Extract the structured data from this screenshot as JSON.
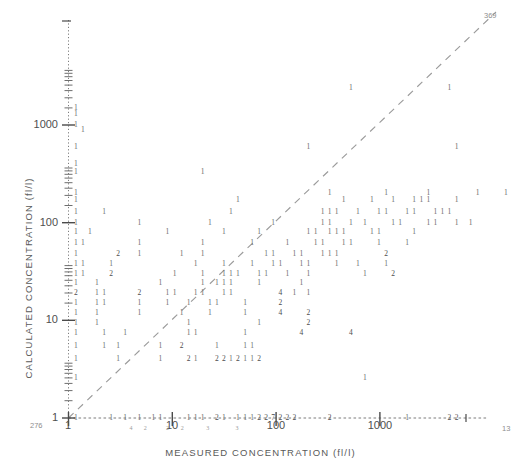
{
  "chart_data": {
    "type": "scatter",
    "title": "",
    "xlabel": "MEASURED CONCENTRATION (fl/l)",
    "ylabel": "CALCULATED CONCENTRATION (fl/l)",
    "xscale": "log",
    "yscale": "log",
    "xlim": [
      1,
      4000
    ],
    "ylim": [
      1,
      6000
    ],
    "grid": false,
    "legend": null,
    "marker_note": "Overprinted line-printer digits; each digit is the count of coincident observations at that cell",
    "xticks": [
      {
        "value": 1,
        "label": "1"
      },
      {
        "value": 10,
        "label": "10"
      },
      {
        "value": 100,
        "label": "100"
      },
      {
        "value": 1000,
        "label": "1000"
      }
    ],
    "yticks": [
      {
        "value": 1,
        "label": "1"
      },
      {
        "value": 10,
        "label": "10"
      },
      {
        "value": 100,
        "label": "100"
      },
      {
        "value": 1000,
        "label": "1000"
      }
    ],
    "reference_line": {
      "style": "dashed",
      "description": "1:1 identity line from (1,1) to upper right",
      "from": [
        1,
        1
      ],
      "to": [
        4000,
        4000
      ]
    },
    "corner_annotations": {
      "top_right": "369",
      "bottom_left": "276",
      "bottom_right": "13"
    },
    "rows": [
      {
        "y": 2400,
        "cells": "                                        1             1"
      },
      {
        "y": 1500,
        "cells": " 1"
      },
      {
        "y": 1300,
        "cells": " 1"
      },
      {
        "y": 1000,
        "cells": " 1"
      },
      {
        "y": 900,
        "cells": "  1"
      },
      {
        "y": 600,
        "cells": " 1                                1                    1"
      },
      {
        "y": 400,
        "cells": " 1"
      },
      {
        "y": 330,
        "cells": " 1                 1"
      },
      {
        "y": 200,
        "cells": " 1                                   1       1     1      1   1"
      },
      {
        "y": 170,
        "cells": " 1                      1              1   1  1  111   1"
      },
      {
        "y": 130,
        "cells": " 1   1                 1            111  1  11  11  111"
      },
      {
        "y": 100,
        "cells": " 1        1         1        1      11  1 1   11   11  1 1"
      },
      {
        "y": 80,
        "cells": " 1 1          1       1    1      11 111   11    1"
      },
      {
        "y": 62,
        "cells": " 11       1        1      1    1   11  11   1   1"
      },
      {
        "y": 48,
        "cells": " 1     2  1     1  1        11  11  111      2"
      },
      {
        "y": 38,
        "cells": " 11   1           1   1   1  11  11   1  1   1"
      },
      {
        "y": 30,
        "cells": " 11   2        1   1  111  11  1  1       1   2"
      },
      {
        "y": 24,
        "cells": " 1  1        1     1 111   1     1"
      },
      {
        "y": 19,
        "cells": " 2  11    2   11  11  11      4 1 1"
      },
      {
        "y": 15,
        "cells": " 1  11    1   1  1  11   1    2"
      },
      {
        "y": 12,
        "cells": " 1  1     1     1   1    1    4   2"
      },
      {
        "y": 9.5,
        "cells": " 1  1            1         1      2"
      },
      {
        "y": 7.5,
        "cells": " 1   1  1        11      1       4      4"
      },
      {
        "y": 5.5,
        "cells": " 1   1 1     1  2    1   11"
      },
      {
        "y": 4.0,
        "cells": " 1     1     1   21  2212112"
      },
      {
        "y": 2.6,
        "cells": " 1                                        1"
      },
      {
        "y": 1.0,
        "cells": " 1    1 1 1 11   111 21 111227222    2          1     22"
      }
    ],
    "below_axis_marks": [
      {
        "x": 4.0,
        "label": "4"
      },
      {
        "x": 5.5,
        "label": "2"
      },
      {
        "x": 9.0,
        "label": "2"
      },
      {
        "x": 12.5,
        "label": "2"
      },
      {
        "x": 22,
        "label": "3"
      },
      {
        "x": 42,
        "label": "3"
      }
    ]
  }
}
